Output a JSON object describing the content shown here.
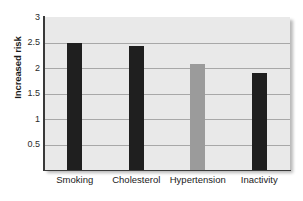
{
  "chart_data": {
    "type": "bar",
    "title": "",
    "xlabel": "",
    "ylabel": "Increased risk",
    "categories": [
      "Smoking",
      "Cholesterol",
      "Hypertension",
      "Inactivity"
    ],
    "values": [
      2.5,
      2.43,
      2.07,
      1.91
    ],
    "series": [
      {
        "name": "Increased risk",
        "values": [
          2.5,
          2.43,
          2.07,
          1.91
        ]
      }
    ],
    "bar_colors": [
      "#1f1f1f",
      "#1f1f1f",
      "#9b9b9b",
      "#1f1f1f"
    ],
    "ylim": [
      0,
      3
    ],
    "ytick_labels": [
      "3",
      "2.5",
      "2",
      "1.5",
      "1",
      "0.5"
    ],
    "ytick_values": [
      3,
      2.5,
      2,
      1.5,
      1,
      0.5
    ],
    "grid": true,
    "legend": false,
    "legend_position": "none",
    "plot_background": "#e9e9e9",
    "gridline_color": "#a8a8a8",
    "axis_color": "#3a3a3a"
  }
}
